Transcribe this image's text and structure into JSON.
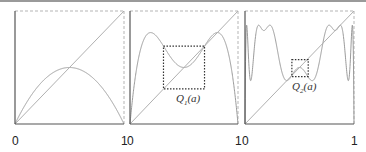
{
  "chart_data": [
    {
      "type": "line",
      "title": "",
      "xlabel": "",
      "ylabel": "",
      "xlim": [
        0,
        1
      ],
      "ylim": [
        0,
        1
      ],
      "x_tick_labels": [
        "0",
        "1"
      ],
      "grid": false,
      "series": [
        {
          "name": "f(x) = a x (1 - x)",
          "function": "logistic",
          "iterate": 1,
          "a": 2.0
        },
        {
          "name": "diagonal y = x",
          "function": "identity"
        }
      ],
      "annotation": null
    },
    {
      "type": "line",
      "title": "",
      "xlabel": "",
      "ylabel": "",
      "xlim": [
        0,
        1
      ],
      "ylim": [
        0,
        1
      ],
      "x_tick_labels": [
        "0",
        "1"
      ],
      "grid": false,
      "series": [
        {
          "name": "f^2(x)",
          "function": "logistic",
          "iterate": 2,
          "a": 3.236
        },
        {
          "name": "diagonal y = x",
          "function": "identity"
        }
      ],
      "annotation": {
        "label": "Q",
        "subscript": "1",
        "suffix": "(a)",
        "box_x": [
          0.31,
          0.69
        ],
        "box_y": [
          0.31,
          0.69
        ]
      }
    },
    {
      "type": "line",
      "title": "",
      "xlabel": "",
      "ylabel": "",
      "xlim": [
        0,
        1
      ],
      "ylim": [
        0,
        1
      ],
      "x_tick_labels": [
        "0",
        "1"
      ],
      "grid": false,
      "series": [
        {
          "name": "f^4(x)",
          "function": "logistic",
          "iterate": 4,
          "a": 3.4986
        },
        {
          "name": "diagonal y = x",
          "function": "identity"
        }
      ],
      "annotation": {
        "label": "Q",
        "subscript": "2",
        "suffix": "(a)",
        "box_x": [
          0.43,
          0.58
        ],
        "box_y": [
          0.42,
          0.57
        ]
      }
    }
  ],
  "colors": {
    "curve": "#9a9a9a",
    "diagonal": "#b0b0b0",
    "axis": "#555555",
    "frame": "#b5b5b5",
    "box": "#333333"
  }
}
